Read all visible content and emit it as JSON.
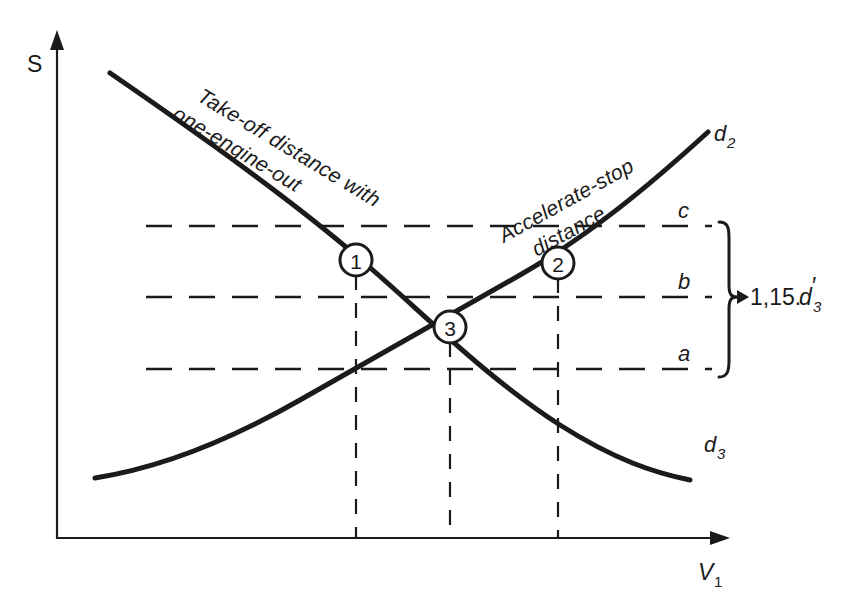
{
  "figure": {
    "background_color": "#ffffff",
    "ink_color": "#1b1b1b"
  },
  "axes": {
    "y_label": "S",
    "x_label": "V",
    "x_label_sub": "1"
  },
  "curves": [
    {
      "id": "takeoff",
      "name": "Take-off distance with one-engine-out",
      "name_line1": "Take-off distance with",
      "name_line2": "one-engine-out",
      "end_label": "d",
      "end_label_sub": "3",
      "direction": "descending"
    },
    {
      "id": "acceleratestop",
      "name": "Accelerate-stop distance",
      "name_line1": "Accelerate-stop",
      "name_line2": "distance",
      "end_label": "d",
      "end_label_sub": "2",
      "direction": "ascending"
    }
  ],
  "markers": [
    {
      "id": "marker-1",
      "label": "1"
    },
    {
      "id": "marker-2",
      "label": "2"
    },
    {
      "id": "marker-3",
      "label": "3"
    }
  ],
  "levels": [
    {
      "id": "level-c",
      "label": "c"
    },
    {
      "id": "level-b",
      "label": "b"
    },
    {
      "id": "level-a",
      "label": "a"
    }
  ],
  "annotation": {
    "value": "1,15.",
    "symbol": "d",
    "prime": "′",
    "subscript": "3",
    "full": "1,15.d′₃"
  }
}
